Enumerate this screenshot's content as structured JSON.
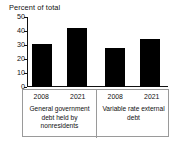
{
  "chart_data": {
    "type": "bar",
    "title": "Percent of total",
    "xlabel": "",
    "ylabel": "",
    "ylim": [
      0,
      50
    ],
    "yticks": [
      50,
      40,
      30,
      20,
      10,
      0
    ],
    "grid": false,
    "legend": "none",
    "bar_color": "#000000",
    "axis_color": "#111111",
    "categories": [
      "2008",
      "2021",
      "2008",
      "2021"
    ],
    "values": [
      31,
      42,
      28,
      34.5
    ],
    "groups": [
      {
        "label": "General government debt held by nonresidents",
        "label_lines": [
          "General government",
          "debt held by",
          "nonresidents"
        ],
        "categories": [
          "2008",
          "2021"
        ],
        "values": [
          31,
          42
        ]
      },
      {
        "label": "Variable rate external debt",
        "label_lines": [
          "Variable rate external",
          "debt"
        ],
        "categories": [
          "2008",
          "2021"
        ],
        "values": [
          28,
          34.5
        ]
      }
    ]
  }
}
